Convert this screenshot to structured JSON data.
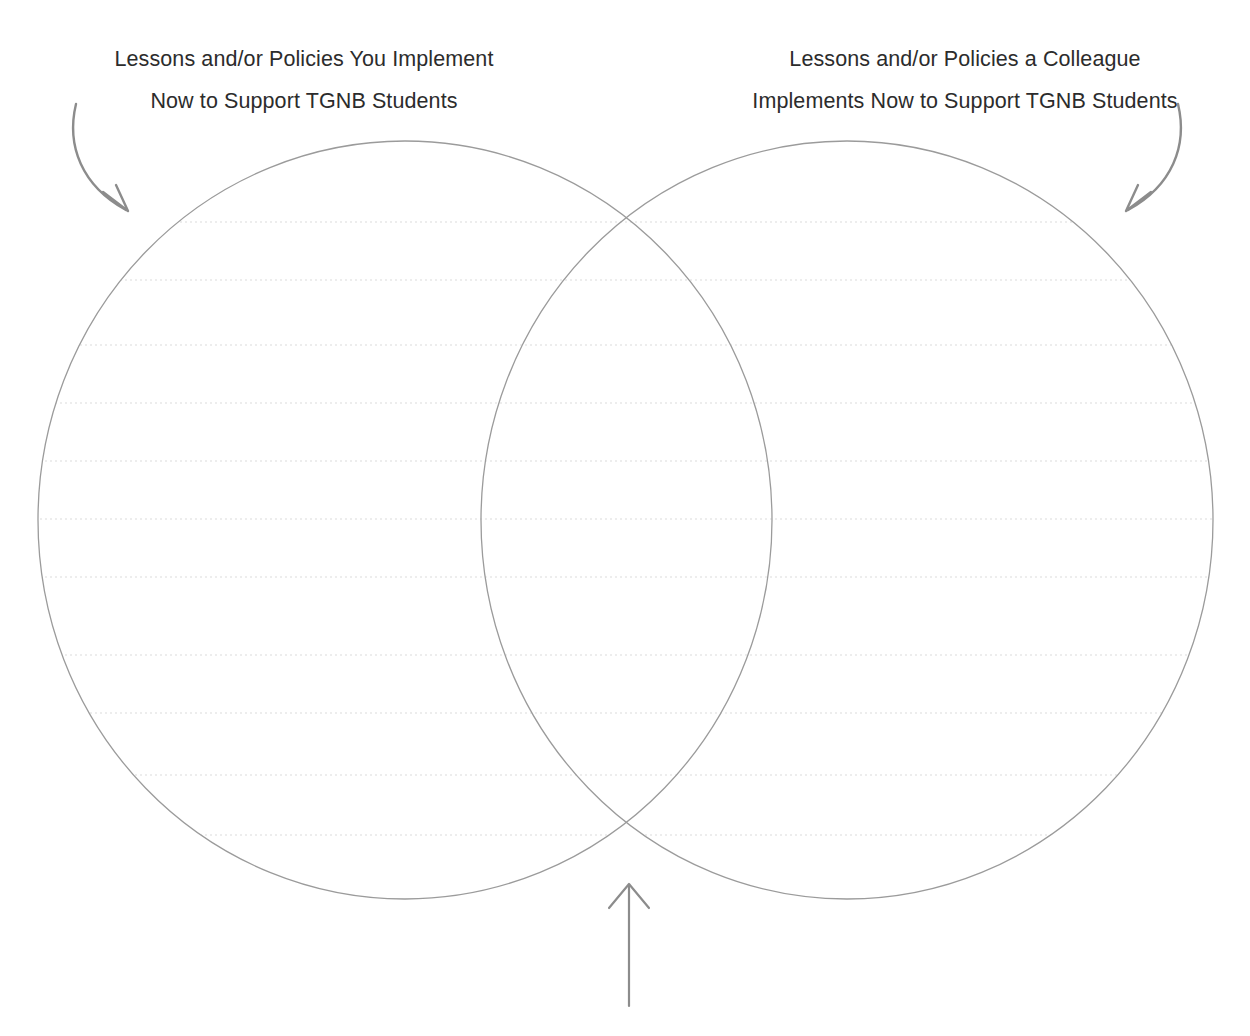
{
  "page": {
    "type": "venn-diagram-worksheet",
    "width": 1250,
    "height": 1036,
    "background_color": "#ffffff"
  },
  "headings": {
    "left": {
      "line1": "Lessons and/or Policies You Implement",
      "line2": "Now to Support TGNB Students"
    },
    "right": {
      "line1": "Lessons and/or Policies a Colleague",
      "line2": "Implements Now to Support TGNB Students"
    }
  },
  "colors": {
    "text": "#2c2c2c",
    "circle_stroke": "#9b9b9b",
    "rule_line": "#dcdcdc",
    "arrow": "#8c8c8c"
  },
  "diagram": {
    "left_circle": {
      "cx": 405,
      "cy": 520,
      "rx": 367,
      "ry": 379
    },
    "right_circle": {
      "cx": 847,
      "cy": 520,
      "rx": 366,
      "ry": 379
    },
    "rule_line_spacing": 58,
    "rule_line_first_y": 222,
    "rule_line_count": 12
  },
  "arrows": {
    "left": {
      "name": "arrow-to-left-circle",
      "direction": "down-right"
    },
    "right": {
      "name": "arrow-to-right-circle",
      "direction": "down-left"
    },
    "center": {
      "name": "arrow-to-overlap",
      "direction": "up"
    }
  }
}
